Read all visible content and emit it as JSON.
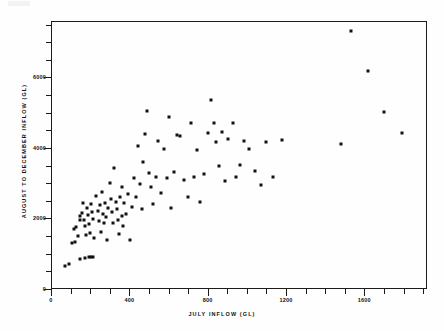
{
  "figure": {
    "background_color": "#ffffff",
    "foreground_color": "#111111",
    "artifact_note": ""
  },
  "axes": {
    "x_title": "JULY  INFLOW (GL)",
    "y_title": "AUGUST  TO  DECEMBER  INFLOW (GL)",
    "x_ticks": [
      "0",
      "400",
      "800",
      "1200",
      "1600"
    ],
    "y_ticks": [
      "0",
      "2000",
      "4000",
      "6000"
    ]
  },
  "chart_data": {
    "type": "scatter",
    "title": "",
    "subtitle": "",
    "xlabel": "JULY  INFLOW (GL)",
    "ylabel": "AUGUST  TO  DECEMBER  INFLOW (GL)",
    "xlim": [
      0,
      1920
    ],
    "ylim": [
      0,
      7600
    ],
    "x_ticks": [
      0,
      400,
      800,
      1200,
      1600
    ],
    "y_ticks": [
      0,
      2000,
      4000,
      6000
    ],
    "x_minor_tick_step": 100,
    "y_minor_tick_step": 500,
    "grid": false,
    "legend": null,
    "marker": "square",
    "marker_color": "#111111",
    "marker_size_px": 3,
    "series": [
      {
        "name": "July vs August-to-December inflow",
        "points": [
          [
            70,
            640
          ],
          [
            90,
            700
          ],
          [
            105,
            1300
          ],
          [
            120,
            1320
          ],
          [
            115,
            1700
          ],
          [
            130,
            1760
          ],
          [
            140,
            1500
          ],
          [
            150,
            2080
          ],
          [
            160,
            2150
          ],
          [
            165,
            2450
          ],
          [
            150,
            1950
          ],
          [
            170,
            1960
          ],
          [
            175,
            1780
          ],
          [
            180,
            1520
          ],
          [
            185,
            2300
          ],
          [
            190,
            2100
          ],
          [
            195,
            1850
          ],
          [
            200,
            1600
          ],
          [
            205,
            2420
          ],
          [
            210,
            2180
          ],
          [
            215,
            1990
          ],
          [
            218,
            1450
          ],
          [
            150,
            860
          ],
          [
            175,
            880
          ],
          [
            195,
            900
          ],
          [
            205,
            905
          ],
          [
            215,
            910
          ],
          [
            230,
            2650
          ],
          [
            240,
            2200
          ],
          [
            245,
            1930
          ],
          [
            250,
            2380
          ],
          [
            255,
            1620
          ],
          [
            260,
            2750
          ],
          [
            268,
            2120
          ],
          [
            270,
            1880
          ],
          [
            275,
            2450
          ],
          [
            280,
            2050
          ],
          [
            285,
            1400
          ],
          [
            290,
            2300
          ],
          [
            300,
            3000
          ],
          [
            305,
            2550
          ],
          [
            310,
            2170
          ],
          [
            315,
            1870
          ],
          [
            320,
            3420
          ],
          [
            330,
            2480
          ],
          [
            335,
            2260
          ],
          [
            340,
            1960
          ],
          [
            345,
            1560
          ],
          [
            350,
            2600
          ],
          [
            360,
            2080
          ],
          [
            365,
            2900
          ],
          [
            370,
            1780
          ],
          [
            375,
            2430
          ],
          [
            385,
            2120
          ],
          [
            395,
            2700
          ],
          [
            405,
            1380
          ],
          [
            415,
            2330
          ],
          [
            425,
            3150
          ],
          [
            435,
            2620
          ],
          [
            445,
            4050
          ],
          [
            455,
            2980
          ],
          [
            465,
            2260
          ],
          [
            470,
            3600
          ],
          [
            480,
            4400
          ],
          [
            490,
            5050
          ],
          [
            500,
            3280
          ],
          [
            510,
            2880
          ],
          [
            520,
            2400
          ],
          [
            535,
            3180
          ],
          [
            545,
            4200
          ],
          [
            560,
            2730
          ],
          [
            575,
            3960
          ],
          [
            590,
            3150
          ],
          [
            600,
            4880
          ],
          [
            615,
            2300
          ],
          [
            630,
            3320
          ],
          [
            645,
            4380
          ],
          [
            660,
            4350
          ],
          [
            680,
            3100
          ],
          [
            700,
            2600
          ],
          [
            715,
            4720
          ],
          [
            730,
            3180
          ],
          [
            745,
            3950
          ],
          [
            760,
            2480
          ],
          [
            780,
            3260
          ],
          [
            800,
            4420
          ],
          [
            815,
            5350
          ],
          [
            830,
            4720
          ],
          [
            845,
            4180
          ],
          [
            860,
            3480
          ],
          [
            875,
            4460
          ],
          [
            890,
            3050
          ],
          [
            905,
            4250
          ],
          [
            930,
            4720
          ],
          [
            945,
            3180
          ],
          [
            965,
            3520
          ],
          [
            985,
            4200
          ],
          [
            1010,
            3980
          ],
          [
            1040,
            3360
          ],
          [
            1070,
            2960
          ],
          [
            1100,
            4180
          ],
          [
            1135,
            3180
          ],
          [
            1180,
            4220
          ],
          [
            1480,
            4100
          ],
          [
            1530,
            7320
          ],
          [
            1620,
            6180
          ],
          [
            1700,
            5030
          ],
          [
            1790,
            4420
          ]
        ]
      }
    ]
  }
}
